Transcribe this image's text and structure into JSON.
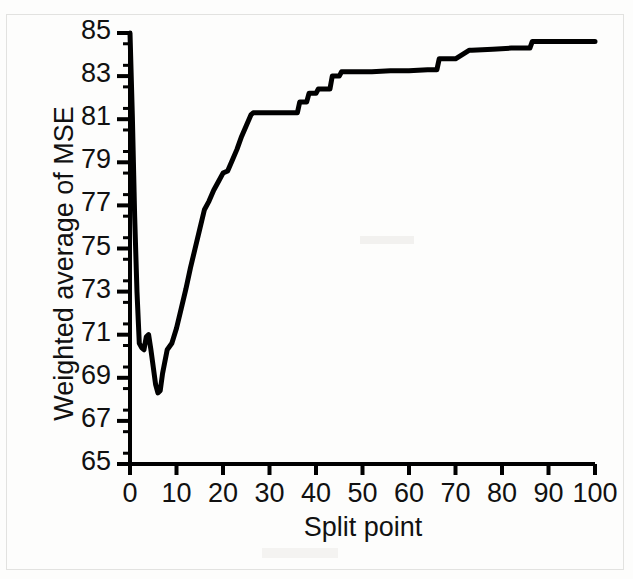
{
  "chart_data": {
    "type": "line",
    "title": "",
    "subtitle": "",
    "xlabel": "Split point",
    "ylabel": "Weighted average of MSE",
    "xlim": [
      0,
      100
    ],
    "ylim": [
      65,
      85
    ],
    "xticks": [
      0,
      10,
      20,
      30,
      40,
      50,
      60,
      70,
      80,
      90,
      100
    ],
    "xtick_labels": [
      "0",
      "10",
      "20",
      "30",
      "40",
      "50",
      "60",
      "70",
      "80",
      "90",
      "100"
    ],
    "yticks": [
      65,
      67,
      69,
      71,
      73,
      75,
      77,
      79,
      81,
      83,
      85
    ],
    "ytick_labels": [
      "65",
      "67",
      "69",
      "71",
      "73",
      "75",
      "77",
      "79",
      "81",
      "83",
      "85"
    ],
    "y_minor_tick_step": 0.5,
    "grid": false,
    "legend": null,
    "line_color": "#000000",
    "line_width_px": 5,
    "axis_color": "#000000",
    "background_color": "#ffffff",
    "series": [
      {
        "name": "Weighted average of MSE vs split point",
        "x": [
          0,
          0.5,
          1,
          1.5,
          2,
          2.5,
          3,
          3.5,
          4,
          4.5,
          5,
          5.5,
          6,
          6.5,
          7,
          8,
          9,
          10,
          11,
          12,
          13,
          14,
          15,
          16,
          17,
          18,
          19,
          20,
          21,
          22,
          23,
          24,
          25,
          26,
          26.5,
          30,
          33,
          36,
          36.5,
          38,
          38.5,
          40,
          40.5,
          43,
          43.5,
          45,
          45.5,
          52,
          56,
          60,
          64,
          66,
          66.5,
          70,
          73,
          73.5,
          78,
          82,
          86,
          86.5,
          90,
          95,
          100
        ],
        "y": [
          85,
          81.2,
          76.5,
          73,
          70.6,
          70.4,
          70.3,
          70.9,
          71,
          70.3,
          69.5,
          68.7,
          68.3,
          68.4,
          69.2,
          70.3,
          70.6,
          71.3,
          72.2,
          73.1,
          74.1,
          75,
          75.9,
          76.8,
          77.2,
          77.7,
          78.1,
          78.5,
          78.6,
          79.1,
          79.6,
          80.2,
          80.7,
          81.2,
          81.3,
          81.3,
          81.3,
          81.3,
          81.8,
          81.8,
          82.2,
          82.2,
          82.4,
          82.4,
          83,
          83,
          83.2,
          83.2,
          83.25,
          83.25,
          83.3,
          83.3,
          83.8,
          83.8,
          84.2,
          84.2,
          84.25,
          84.3,
          84.3,
          84.6,
          84.6,
          84.6,
          84.6
        ]
      }
    ],
    "annotations": {
      "minimum": {
        "x": 6,
        "y": 68.3
      },
      "start": {
        "x": 0,
        "y": 85
      },
      "end": {
        "x": 100,
        "y": 84.6
      }
    }
  },
  "axes": {
    "y_title": "Weighted average of MSE",
    "x_title": "Split point"
  }
}
